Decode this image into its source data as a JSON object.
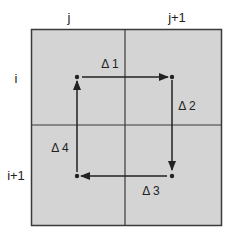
{
  "diagram": {
    "column_labels": [
      "j",
      "j+1"
    ],
    "row_labels": [
      "i",
      "i+1"
    ],
    "edges": [
      {
        "label": "Δ 1",
        "from": "top-left",
        "to": "top-right"
      },
      {
        "label": "Δ 2",
        "from": "top-right",
        "to": "bottom-right"
      },
      {
        "label": "Δ 3",
        "from": "bottom-right",
        "to": "bottom-left"
      },
      {
        "label": "Δ 4",
        "from": "bottom-left",
        "to": "top-left"
      }
    ],
    "colors": {
      "cell_fill": "#d4d4d4",
      "line": "#3a3a3a",
      "background": "#ffffff"
    }
  }
}
